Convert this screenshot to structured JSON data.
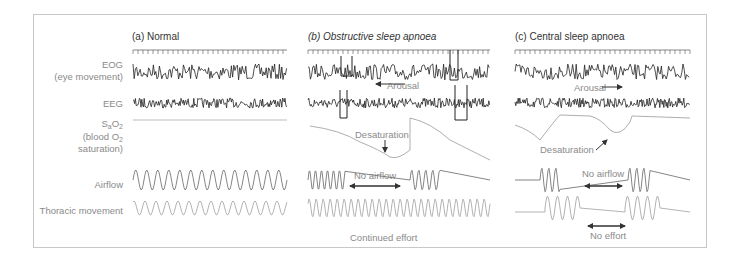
{
  "figure": {
    "panels": [
      {
        "id": "a",
        "title": "(a) Normal"
      },
      {
        "id": "b",
        "title": "(b) Obstructive sleep apnoea"
      },
      {
        "id": "c",
        "title": "(c) Central sleep apnoea"
      }
    ],
    "row_labels": {
      "eog": "EOG",
      "eog_sub": "(eye movement)",
      "eeg": "EEG",
      "sao2_main": "S",
      "sao2_sub1": "a",
      "sao2_mid": "O",
      "sao2_sub2": "2",
      "sao2_line2": "(blood O",
      "sao2_line2_sub": "2",
      "sao2_line3": "saturation)",
      "airflow": "Airflow",
      "thoracic": "Thoracic movement"
    },
    "annotations": {
      "b_arousal": "Arousal",
      "b_desaturation": "Desaturation",
      "b_no_airflow": "No airflow",
      "b_continued_effort": "Continued effort",
      "c_arousal": "Arousal",
      "c_desaturation": "Desaturation",
      "c_no_airflow": "No airflow",
      "c_no_effort": "No effort"
    },
    "colors": {
      "frame": "#c8c8c8",
      "eeg_trace": "#222222",
      "airflow_trace": "#777777",
      "thoracic_trace": "#aaaaaa",
      "sao2_trace": "#999999",
      "label_text": "#8a8a8a"
    }
  }
}
